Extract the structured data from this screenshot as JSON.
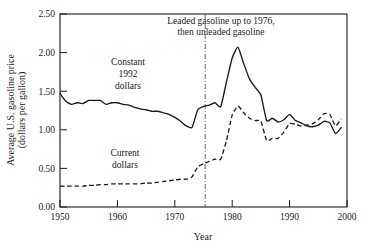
{
  "chart_data": {
    "type": "line",
    "title": "",
    "xlabel": "Year",
    "ylabel": "Average U.S. gasoline price\n(dollars per gallon)",
    "ylabel_line1": "Average U.S. gasoline price",
    "ylabel_line2": "(dollars per gallon)",
    "xlim": [
      1950,
      2000
    ],
    "ylim": [
      0.0,
      2.5
    ],
    "grid": false,
    "legend_position": "inline-labels",
    "xticks": [
      1950,
      1960,
      1970,
      1980,
      1990,
      2000
    ],
    "xtick_labels": [
      "1950",
      "1960",
      "1970",
      "1980",
      "1990",
      "2000"
    ],
    "yticks": [
      0.0,
      0.5,
      1.0,
      1.5,
      2.0,
      2.5
    ],
    "ytick_labels": [
      "0.00",
      "0.50",
      "1.00",
      "1.50",
      "2.00",
      "2.50"
    ],
    "annotations": [
      {
        "name": "leaded-unleaded-note",
        "line1": "Leaded gasoline up to 1976,",
        "line2": "then unleaded gasoline",
        "marker_x": 1976
      }
    ],
    "series": [
      {
        "name": "Constant 1992 dollars",
        "label_line1": "Constant",
        "label_line2": "1992",
        "label_line3": "dollars",
        "style": "solid",
        "color": "#1a1a1a",
        "x": [
          1950,
          1951,
          1952,
          1953,
          1954,
          1955,
          1956,
          1957,
          1958,
          1959,
          1960,
          1961,
          1962,
          1963,
          1964,
          1965,
          1966,
          1967,
          1968,
          1969,
          1970,
          1971,
          1972,
          1973,
          1974,
          1975,
          1976,
          1977,
          1978,
          1979,
          1980,
          1981,
          1982,
          1983,
          1984,
          1985,
          1986,
          1987,
          1988,
          1989,
          1990,
          1991,
          1992,
          1993,
          1994,
          1995,
          1996,
          1997,
          1998,
          1999
        ],
        "values": [
          1.47,
          1.37,
          1.33,
          1.35,
          1.34,
          1.38,
          1.38,
          1.38,
          1.33,
          1.35,
          1.35,
          1.33,
          1.32,
          1.29,
          1.27,
          1.26,
          1.24,
          1.24,
          1.22,
          1.2,
          1.16,
          1.11,
          1.05,
          1.03,
          1.26,
          1.3,
          1.32,
          1.35,
          1.3,
          1.62,
          1.93,
          2.07,
          1.86,
          1.66,
          1.55,
          1.45,
          1.12,
          1.15,
          1.1,
          1.13,
          1.2,
          1.12,
          1.09,
          1.05,
          1.04,
          1.06,
          1.11,
          1.09,
          0.95,
          1.03
        ]
      },
      {
        "name": "Current dollars",
        "label_line1": "Current",
        "label_line2": "dollars",
        "style": "dashed",
        "color": "#1a1a1a",
        "x": [
          1950,
          1951,
          1952,
          1953,
          1954,
          1955,
          1956,
          1957,
          1958,
          1959,
          1960,
          1961,
          1962,
          1963,
          1964,
          1965,
          1966,
          1967,
          1968,
          1969,
          1970,
          1971,
          1972,
          1973,
          1974,
          1975,
          1976,
          1977,
          1978,
          1979,
          1980,
          1981,
          1982,
          1983,
          1984,
          1985,
          1986,
          1987,
          1988,
          1989,
          1990,
          1991,
          1992,
          1993,
          1994,
          1995,
          1996,
          1997,
          1998,
          1999
        ],
        "values": [
          0.27,
          0.27,
          0.27,
          0.27,
          0.27,
          0.28,
          0.28,
          0.29,
          0.29,
          0.3,
          0.3,
          0.3,
          0.3,
          0.3,
          0.3,
          0.31,
          0.31,
          0.32,
          0.33,
          0.34,
          0.35,
          0.36,
          0.36,
          0.39,
          0.52,
          0.56,
          0.59,
          0.62,
          0.62,
          0.86,
          1.19,
          1.31,
          1.22,
          1.15,
          1.12,
          1.11,
          0.86,
          0.89,
          0.89,
          0.97,
          1.08,
          1.07,
          1.05,
          1.06,
          1.08,
          1.13,
          1.21,
          1.2,
          1.05,
          1.14
        ]
      }
    ]
  },
  "axes": {
    "y_title_line1": "Average U.S. gasoline price",
    "y_title_line2": "(dollars per gallon)",
    "x_title": "Year"
  }
}
